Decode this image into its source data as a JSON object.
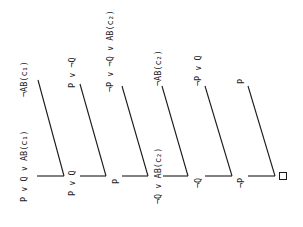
{
  "diagram": {
    "type": "resolution-refutation-tree",
    "orientation": "rotated-90",
    "steps": [
      {
        "left": "P ∨ Q ∨ AB(c₁)",
        "right": "¬AB(c₁)",
        "resolvent": "P ∨ Q"
      },
      {
        "left": "P ∨ Q",
        "right": "P ∨ ¬Q",
        "resolvent": "P"
      },
      {
        "left": "P",
        "right": "¬P ∨ ¬Q ∨ AB(c₂)",
        "resolvent": "¬Q ∨ AB(c₂)"
      },
      {
        "left": "¬Q ∨ AB(c₂)",
        "right": "¬AB(c₂)",
        "resolvent": "¬Q"
      },
      {
        "left": "¬Q",
        "right": "¬P ∨ Q",
        "resolvent": "¬P"
      },
      {
        "left": "¬P",
        "right": "P",
        "resolvent": "□"
      }
    ],
    "labels": {
      "c1_clause": "P ∨ Q ∨ AB(c₁)",
      "not_ab_c1": "¬AB(c₁)",
      "p_or_q": "P ∨ Q",
      "p_or_not_q": "P ∨ ¬Q",
      "p_1": "P",
      "c2_clause": "¬P ∨ ¬Q ∨ AB(c₂)",
      "not_q_or_ab_c2": "¬Q ∨ AB(c₂)",
      "not_ab_c2": "¬AB(c₂)",
      "not_q": "¬Q",
      "not_p_or_q": "¬P ∨ Q",
      "not_p": "¬P",
      "p_2": "P",
      "empty_clause": "□"
    }
  }
}
